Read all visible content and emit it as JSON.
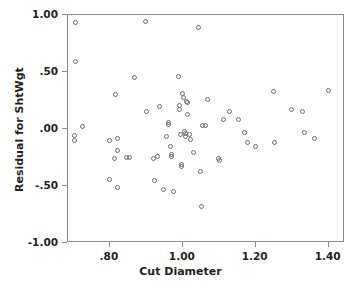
{
  "chart_data": {
    "type": "scatter",
    "title": "",
    "xlabel": "Cut Diameter",
    "ylabel": "Residual for ShtWgt",
    "xlim": [
      0.685,
      1.445
    ],
    "ylim": [
      -1.0,
      1.0
    ],
    "xticks": [
      0.8,
      1.0,
      1.2,
      1.4
    ],
    "xtick_labels": [
      ".80",
      "1.00",
      "1.20",
      "1.40"
    ],
    "yticks": [
      1.0,
      0.5,
      0.0,
      -0.5,
      -1.0
    ],
    "ytick_labels": [
      "1.00",
      ".50",
      ".00",
      "-.50",
      "-1.00"
    ],
    "grid": false,
    "legend": false,
    "marker": "open-circle",
    "marker_color": "#6b6b6b",
    "frame_color": "#8a8a8a",
    "background": "#ffffff",
    "n_points": 74,
    "points": [
      {
        "x": 0.705,
        "y": 0.93
      },
      {
        "x": 0.705,
        "y": 0.59
      },
      {
        "x": 0.703,
        "y": -0.06
      },
      {
        "x": 0.703,
        "y": -0.1
      },
      {
        "x": 0.725,
        "y": 0.02
      },
      {
        "x": 0.8,
        "y": -0.1
      },
      {
        "x": 0.8,
        "y": -0.44
      },
      {
        "x": 0.813,
        "y": -0.26
      },
      {
        "x": 0.815,
        "y": 0.3
      },
      {
        "x": 0.82,
        "y": -0.08
      },
      {
        "x": 0.822,
        "y": -0.19
      },
      {
        "x": 0.822,
        "y": -0.51
      },
      {
        "x": 0.845,
        "y": -0.25
      },
      {
        "x": 0.855,
        "y": -0.25
      },
      {
        "x": 0.868,
        "y": 0.45
      },
      {
        "x": 0.897,
        "y": 0.94
      },
      {
        "x": 0.9,
        "y": 0.15
      },
      {
        "x": 0.92,
        "y": -0.26
      },
      {
        "x": 0.922,
        "y": -0.45
      },
      {
        "x": 0.93,
        "y": -0.24
      },
      {
        "x": 0.935,
        "y": 0.2
      },
      {
        "x": 0.948,
        "y": -0.53
      },
      {
        "x": 0.955,
        "y": -0.07
      },
      {
        "x": 0.96,
        "y": 0.06
      },
      {
        "x": 0.962,
        "y": 0.04
      },
      {
        "x": 0.965,
        "y": -0.15
      },
      {
        "x": 0.968,
        "y": -0.22
      },
      {
        "x": 0.97,
        "y": -0.24
      },
      {
        "x": 0.975,
        "y": -0.55
      },
      {
        "x": 0.988,
        "y": 0.46
      },
      {
        "x": 0.99,
        "y": 0.21
      },
      {
        "x": 0.992,
        "y": 0.17
      },
      {
        "x": 0.995,
        "y": -0.05
      },
      {
        "x": 0.996,
        "y": -0.31
      },
      {
        "x": 0.996,
        "y": -0.33
      },
      {
        "x": 1.0,
        "y": 0.31
      },
      {
        "x": 1.002,
        "y": 0.28
      },
      {
        "x": 1.004,
        "y": -0.02
      },
      {
        "x": 1.006,
        "y": -0.04
      },
      {
        "x": 1.008,
        "y": -0.07
      },
      {
        "x": 1.01,
        "y": 0.24
      },
      {
        "x": 1.012,
        "y": 0.23
      },
      {
        "x": 1.014,
        "y": 0.13
      },
      {
        "x": 1.018,
        "y": -0.05
      },
      {
        "x": 1.02,
        "y": -0.09
      },
      {
        "x": 1.03,
        "y": -0.21
      },
      {
        "x": 1.042,
        "y": 0.89
      },
      {
        "x": 1.048,
        "y": -0.37
      },
      {
        "x": 1.05,
        "y": -0.68
      },
      {
        "x": 1.055,
        "y": 0.03
      },
      {
        "x": 1.062,
        "y": 0.03
      },
      {
        "x": 1.068,
        "y": 0.26
      },
      {
        "x": 1.098,
        "y": -0.26
      },
      {
        "x": 1.102,
        "y": -0.28
      },
      {
        "x": 1.112,
        "y": 0.08
      },
      {
        "x": 1.128,
        "y": 0.15
      },
      {
        "x": 1.152,
        "y": 0.08
      },
      {
        "x": 1.168,
        "y": -0.03
      },
      {
        "x": 1.178,
        "y": -0.12
      },
      {
        "x": 1.2,
        "y": -0.15
      },
      {
        "x": 1.248,
        "y": 0.33
      },
      {
        "x": 1.252,
        "y": -0.12
      },
      {
        "x": 1.298,
        "y": 0.17
      },
      {
        "x": 1.328,
        "y": 0.15
      },
      {
        "x": 1.335,
        "y": -0.03
      },
      {
        "x": 1.36,
        "y": -0.08
      },
      {
        "x": 1.4,
        "y": 0.34
      }
    ]
  }
}
